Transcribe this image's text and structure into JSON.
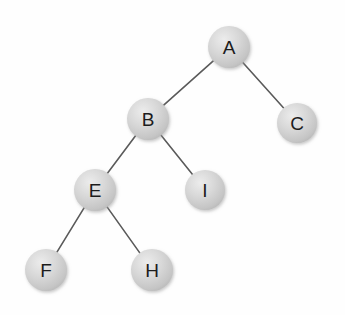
{
  "figure": {
    "background_color": "#fefefe",
    "node_fill_color": "#c9c9c9",
    "node_highlight_color": "#e8e8e8",
    "node_label_color": "#1c1c1c",
    "edge_color": "#5a5a5a"
  },
  "chart_data": {
    "type": "diagram",
    "diagram_type": "binary-tree",
    "title": "",
    "nodes": [
      {
        "id": "A",
        "label": "A",
        "x": 229,
        "y": 47,
        "r": 21,
        "depth": 0
      },
      {
        "id": "B",
        "label": "B",
        "x": 148,
        "y": 119,
        "r": 21,
        "depth": 1
      },
      {
        "id": "C",
        "label": "C",
        "x": 297,
        "y": 123,
        "r": 20,
        "depth": 1
      },
      {
        "id": "E",
        "label": "E",
        "x": 95,
        "y": 190,
        "r": 21,
        "depth": 2
      },
      {
        "id": "I",
        "label": "I",
        "x": 205,
        "y": 190,
        "r": 20,
        "depth": 2
      },
      {
        "id": "F",
        "label": "F",
        "x": 46,
        "y": 270,
        "r": 21,
        "depth": 3
      },
      {
        "id": "H",
        "label": "H",
        "x": 152,
        "y": 270,
        "r": 21,
        "depth": 3
      }
    ],
    "edges": [
      {
        "from": "A",
        "to": "B",
        "side": "left"
      },
      {
        "from": "A",
        "to": "C",
        "side": "right"
      },
      {
        "from": "B",
        "to": "E",
        "side": "left"
      },
      {
        "from": "B",
        "to": "I",
        "side": "right"
      },
      {
        "from": "E",
        "to": "F",
        "side": "left"
      },
      {
        "from": "E",
        "to": "H",
        "side": "right"
      }
    ],
    "root": "A",
    "node_count": 7,
    "edge_count": 6
  }
}
